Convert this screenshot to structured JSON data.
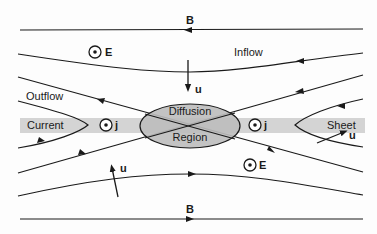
{
  "diagram": {
    "labels": {
      "b_top": "B",
      "b_bottom": "B",
      "inflow": "Inflow",
      "outflow": "Outflow",
      "current": "Current",
      "sheet": "Sheet",
      "diffusion": "Diffusion",
      "region": "Region",
      "e_upper": "E",
      "e_lower": "E",
      "j_left": "j",
      "j_right": "j",
      "u_top": "u",
      "u_right": "u",
      "u_lower": "u"
    },
    "colors": {
      "line": "#1a1a1a",
      "current_sheet_band": "#d4d4d4",
      "diffusion_fill": "#bdbdbd",
      "background": "#fdfdfd"
    }
  }
}
